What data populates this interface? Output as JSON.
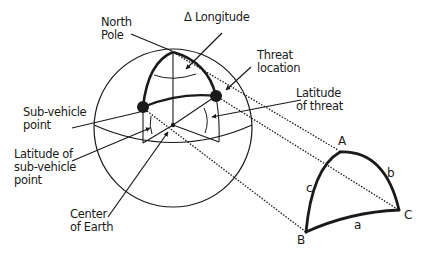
{
  "labels": {
    "north_pole": [
      "North",
      "Pole"
    ],
    "delta_longitude": "Δ Longitude",
    "threat_location": [
      "Threat",
      "location"
    ],
    "latitude_of_threat": [
      "Latitude",
      "of threat"
    ],
    "sub_vehicle_point": [
      "Sub-vehicle",
      "point"
    ],
    "latitude_of_sub_vehicle": [
      "Latitude of",
      "sub-vehicle",
      "point"
    ],
    "center_of_earth": [
      "Center",
      "of Earth"
    ]
  },
  "triangle": {
    "vertices": {
      "A": "A",
      "B": "B",
      "C": "C"
    },
    "sides": {
      "a": "a",
      "b": "b",
      "c": "c"
    }
  },
  "colors": {
    "ink": "#1a1a1a",
    "background": "#ffffff"
  }
}
